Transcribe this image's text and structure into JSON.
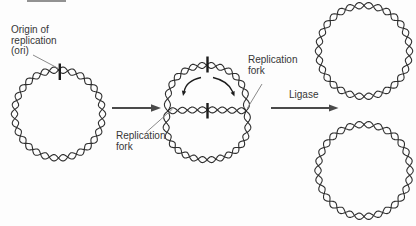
{
  "colors": {
    "background": "#fdfdfd",
    "ink": "#2f2f2f",
    "arrow": "#4a4a4a",
    "pointer": "#8a8a8a",
    "tick": "#1c1c1c",
    "text": "#363636",
    "fragment": "#6e6e6e"
  },
  "labels": {
    "origin": "Origin of\nreplication\n(ori)",
    "replication_fork_left": "Replication\nfork",
    "replication_fork_right": "Replication\nfork",
    "ligase": "Ligase"
  }
}
